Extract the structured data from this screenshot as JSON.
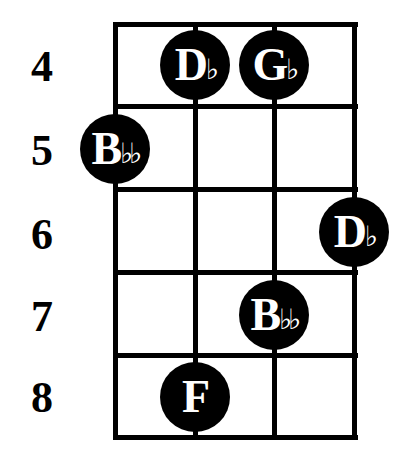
{
  "diagram": {
    "type": "chord-diagram",
    "fret_labels": [
      "4",
      "5",
      "6",
      "7",
      "8"
    ],
    "notes": [
      {
        "letter": "D",
        "accidental": "♭",
        "fret": "4",
        "string": 2
      },
      {
        "letter": "G",
        "accidental": "♭",
        "fret": "4",
        "string": 3
      },
      {
        "letter": "B",
        "accidental": "♭♭",
        "fret": "5",
        "string": 1
      },
      {
        "letter": "D",
        "accidental": "♭",
        "fret": "6",
        "string": 4
      },
      {
        "letter": "B",
        "accidental": "♭♭",
        "fret": "7",
        "string": 3
      },
      {
        "letter": "F",
        "accidental": "",
        "fret": "8",
        "string": 2
      }
    ]
  }
}
